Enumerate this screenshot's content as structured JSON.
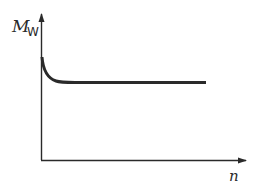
{
  "diagram": {
    "y_axis_label": "M",
    "y_axis_subscript": "W",
    "x_axis_label": "n",
    "curve_description": "Steep initial decrease from the y-axis, then constant (horizontal) for increasing n",
    "colors": {
      "stroke": "#2a2a2a",
      "background": "#ffffff"
    }
  }
}
